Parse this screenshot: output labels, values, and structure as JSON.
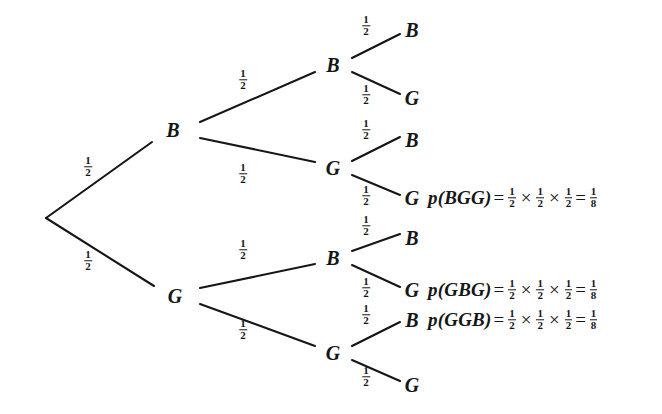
{
  "diagram": {
    "stroke_color": "#161616",
    "background_color": "#ffffff",
    "nodes": [
      {
        "id": "root",
        "label": "",
        "x": 46,
        "y": 218
      },
      {
        "id": "l1-b",
        "label": "B",
        "x": 173,
        "y": 130
      },
      {
        "id": "l1-g",
        "label": "G",
        "x": 175,
        "y": 296
      },
      {
        "id": "l2-bb",
        "label": "B",
        "x": 333,
        "y": 65
      },
      {
        "id": "l2-bg",
        "label": "G",
        "x": 333,
        "y": 168
      },
      {
        "id": "l2-gb",
        "label": "B",
        "x": 333,
        "y": 258
      },
      {
        "id": "l2-gg",
        "label": "G",
        "x": 333,
        "y": 353
      },
      {
        "id": "l3-bbb",
        "label": "B",
        "x": 412,
        "y": 30
      },
      {
        "id": "l3-bbg",
        "label": "G",
        "x": 412,
        "y": 98
      },
      {
        "id": "l3-bgb",
        "label": "B",
        "x": 412,
        "y": 140
      },
      {
        "id": "l3-bgg",
        "label": "G",
        "x": 412,
        "y": 198
      },
      {
        "id": "l3-gbb",
        "label": "B",
        "x": 412,
        "y": 238
      },
      {
        "id": "l3-gbg",
        "label": "G",
        "x": 412,
        "y": 290
      },
      {
        "id": "l3-ggb",
        "label": "B",
        "x": 412,
        "y": 320
      },
      {
        "id": "l3-ggg",
        "label": "G",
        "x": 412,
        "y": 385
      }
    ],
    "edges": [
      {
        "id": "e-root-b",
        "x1": 46,
        "y1": 218,
        "x2": 152,
        "y2": 142
      },
      {
        "id": "e-root-g",
        "x1": 46,
        "y1": 218,
        "x2": 154,
        "y2": 286
      },
      {
        "id": "e-b-bb",
        "x1": 200,
        "y1": 122,
        "x2": 315,
        "y2": 72
      },
      {
        "id": "e-b-bg",
        "x1": 200,
        "y1": 138,
        "x2": 315,
        "y2": 162
      },
      {
        "id": "e-g-gb",
        "x1": 200,
        "y1": 288,
        "x2": 315,
        "y2": 264
      },
      {
        "id": "e-g-gg",
        "x1": 200,
        "y1": 304,
        "x2": 315,
        "y2": 346
      },
      {
        "id": "e-bb-bbb",
        "x1": 352,
        "y1": 58,
        "x2": 400,
        "y2": 34
      },
      {
        "id": "e-bb-bbg",
        "x1": 352,
        "y1": 72,
        "x2": 400,
        "y2": 94
      },
      {
        "id": "e-bg-bgb",
        "x1": 352,
        "y1": 161,
        "x2": 400,
        "y2": 137
      },
      {
        "id": "e-bg-bgg",
        "x1": 352,
        "y1": 175,
        "x2": 400,
        "y2": 195
      },
      {
        "id": "e-gb-gbb",
        "x1": 352,
        "y1": 251,
        "x2": 400,
        "y2": 234
      },
      {
        "id": "e-gb-gbg",
        "x1": 352,
        "y1": 265,
        "x2": 400,
        "y2": 287
      },
      {
        "id": "e-gg-ggb",
        "x1": 352,
        "y1": 346,
        "x2": 400,
        "y2": 322
      },
      {
        "id": "e-gg-ggg",
        "x1": 352,
        "y1": 360,
        "x2": 400,
        "y2": 381
      }
    ],
    "edge_labels": [
      {
        "id": "p-root-b",
        "numerator": "1",
        "denominator": "2",
        "x": 88,
        "y": 167
      },
      {
        "id": "p-root-g",
        "numerator": "1",
        "denominator": "2",
        "x": 88,
        "y": 261
      },
      {
        "id": "p-b-bb",
        "numerator": "1",
        "denominator": "2",
        "x": 243,
        "y": 80
      },
      {
        "id": "p-b-bg",
        "numerator": "1",
        "denominator": "2",
        "x": 243,
        "y": 174
      },
      {
        "id": "p-g-gb",
        "numerator": "1",
        "denominator": "2",
        "x": 243,
        "y": 250
      },
      {
        "id": "p-g-gg",
        "numerator": "1",
        "denominator": "2",
        "x": 243,
        "y": 330
      },
      {
        "id": "p-bb-bbb",
        "numerator": "1",
        "denominator": "2",
        "x": 366,
        "y": 26
      },
      {
        "id": "p-bb-bbg",
        "numerator": "1",
        "denominator": "2",
        "x": 366,
        "y": 95
      },
      {
        "id": "p-bg-bgb",
        "numerator": "1",
        "denominator": "2",
        "x": 366,
        "y": 130
      },
      {
        "id": "p-bg-bgg",
        "numerator": "1",
        "denominator": "2",
        "x": 366,
        "y": 196
      },
      {
        "id": "p-gb-gbb",
        "numerator": "1",
        "denominator": "2",
        "x": 366,
        "y": 226
      },
      {
        "id": "p-gb-gbg",
        "numerator": "1",
        "denominator": "2",
        "x": 366,
        "y": 288
      },
      {
        "id": "p-gg-ggb",
        "numerator": "1",
        "denominator": "2",
        "x": 366,
        "y": 315
      },
      {
        "id": "p-gg-ggg",
        "numerator": "1",
        "denominator": "2",
        "x": 366,
        "y": 377
      }
    ],
    "formulas": [
      {
        "id": "formula-bgg",
        "outcome": "BGG",
        "lhs": "p(BGG)",
        "equals": "=",
        "factors": [
          {
            "numerator": "1",
            "denominator": "2"
          },
          {
            "numerator": "1",
            "denominator": "2"
          },
          {
            "numerator": "1",
            "denominator": "2"
          }
        ],
        "times": "×",
        "result": {
          "numerator": "1",
          "denominator": "8"
        },
        "x": 428,
        "y": 198
      },
      {
        "id": "formula-gbg",
        "outcome": "GBG",
        "lhs": "p(GBG)",
        "equals": "=",
        "factors": [
          {
            "numerator": "1",
            "denominator": "2"
          },
          {
            "numerator": "1",
            "denominator": "2"
          },
          {
            "numerator": "1",
            "denominator": "2"
          }
        ],
        "times": "×",
        "result": {
          "numerator": "1",
          "denominator": "8"
        },
        "x": 428,
        "y": 290
      },
      {
        "id": "formula-ggb",
        "outcome": "GGB",
        "lhs": "p(GGB)",
        "equals": "=",
        "factors": [
          {
            "numerator": "1",
            "denominator": "2"
          },
          {
            "numerator": "1",
            "denominator": "2"
          },
          {
            "numerator": "1",
            "denominator": "2"
          }
        ],
        "times": "×",
        "result": {
          "numerator": "1",
          "denominator": "8"
        },
        "x": 428,
        "y": 320
      }
    ]
  }
}
